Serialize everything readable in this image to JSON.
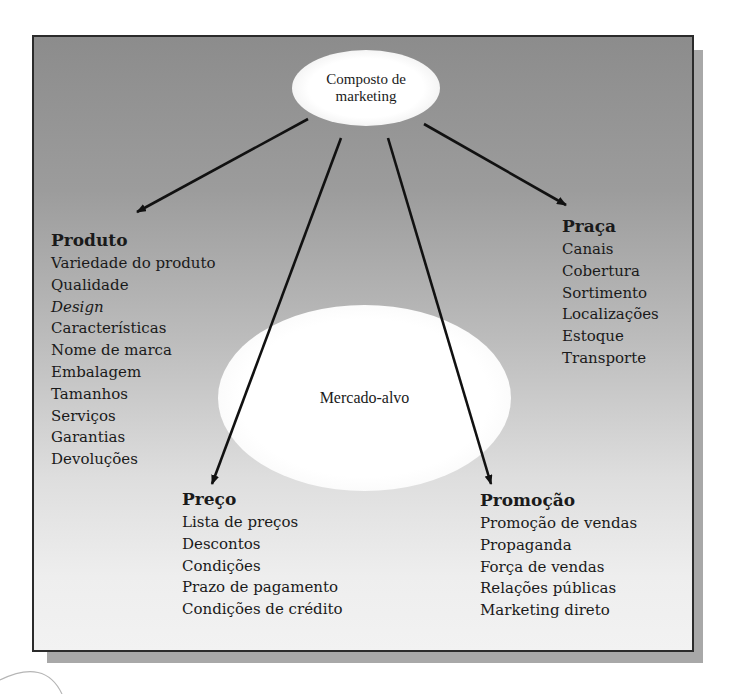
{
  "diagram": {
    "center_node": {
      "line1": "Composto de",
      "line2": "marketing"
    },
    "target_node": {
      "label": "Mercado-alvo"
    },
    "groups": {
      "produto": {
        "title": "Produto",
        "items": [
          "Variedade do produto",
          "Qualidade",
          "Design",
          "Características",
          "Nome de marca",
          "Embalagem",
          "Tamanhos",
          "Serviços",
          "Garantias",
          "Devoluções"
        ],
        "italic_items": [
          "Design"
        ]
      },
      "praca": {
        "title": "Praça",
        "items": [
          "Canais",
          "Cobertura",
          "Sortimento",
          "Localizações",
          "Estoque",
          "Transporte"
        ]
      },
      "preco": {
        "title": "Preço",
        "items": [
          "Lista de preços",
          "Descontos",
          "Condições",
          "Prazo de pagamento",
          "Condições de crédito"
        ]
      },
      "promocao": {
        "title": "Promoção",
        "items": [
          "Promoção de vendas",
          "Propaganda",
          "Força de vendas",
          "Relações públicas",
          "Marketing direto"
        ]
      }
    },
    "arrows": [
      {
        "from": "Composto de marketing",
        "to": "Produto"
      },
      {
        "from": "Composto de marketing",
        "to": "Preço"
      },
      {
        "from": "Composto de marketing",
        "to": "Promoção"
      },
      {
        "from": "Composto de marketing",
        "to": "Praça"
      }
    ],
    "colors": {
      "frame_top": "#8c8c8c",
      "frame_bottom": "#f2f2f2",
      "shadow": "#a8a8a8",
      "arrow": "#111111",
      "ellipse": "#ffffff"
    }
  }
}
